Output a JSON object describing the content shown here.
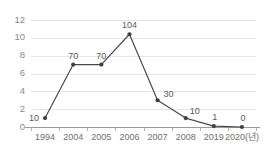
{
  "chart_data": {
    "type": "line",
    "title": "",
    "subtitle": "",
    "xlabel": "",
    "ylabel": "",
    "categories": [
      "1994",
      "2004",
      "2005",
      "2006",
      "2007",
      "2008",
      "2019",
      "2020(년)"
    ],
    "values": [
      10,
      70,
      70,
      104,
      30,
      10,
      1,
      0
    ],
    "plotted_values": [
      1.0,
      7.0,
      7.0,
      10.4,
      3.0,
      1.0,
      0.1,
      0.0
    ],
    "point_labels": [
      "10",
      "70",
      "70",
      "104",
      "30",
      "10",
      "1",
      "0"
    ],
    "ylim": [
      0,
      12
    ],
    "yticks": [
      0,
      2,
      4,
      6,
      8,
      10,
      12
    ],
    "ytick_labels": [
      "0",
      "2",
      "4",
      "6",
      "8",
      "10",
      "12"
    ],
    "grid": true,
    "grid_axis": "y",
    "legend": false,
    "legend_position": "none",
    "marker": "circle",
    "series": [
      {
        "name": "",
        "values": [
          10,
          70,
          70,
          104,
          30,
          10,
          1,
          0
        ]
      }
    ],
    "colors": {
      "line": "#4a4a4a",
      "marker": "#3f3f3f",
      "grid": "#e6e6e6",
      "axis": "#9a9a9a",
      "tick_text": "#6f6f6f",
      "ytick_text": "#8a8a8a",
      "label_text": "#5a5a5a",
      "background": "#ffffff"
    }
  }
}
